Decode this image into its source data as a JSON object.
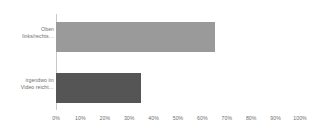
{
  "chart_data": {
    "type": "bar",
    "orientation": "horizontal",
    "title": "",
    "subtitle": "",
    "xlabel": "",
    "ylabel": "",
    "categories": [
      "Oben\nlinks/rechts…",
      "irgendwo im\nVideo reicht…"
    ],
    "values": [
      65,
      35
    ],
    "value_unit": "%",
    "xlim": [
      0,
      100
    ],
    "xticks": [
      0,
      10,
      20,
      30,
      40,
      50,
      60,
      70,
      80,
      90,
      100
    ],
    "xtick_labels": [
      "0%",
      "10%",
      "20%",
      "30%",
      "40%",
      "50%",
      "60%",
      "70%",
      "80%",
      "90%",
      "100%"
    ],
    "grid": false,
    "legend": false,
    "legend_position": "none",
    "bar_colors": [
      "#9a9a9a",
      "#555555"
    ],
    "axis_color": "#c9c9c9",
    "text_color": "#6e6e6e",
    "background_color": "#ffffff",
    "data_labels": false
  }
}
